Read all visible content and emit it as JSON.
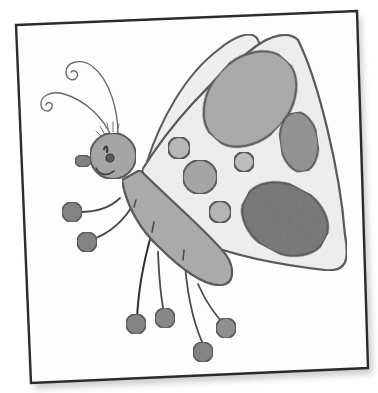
{
  "image": {
    "subject": "pencil drawing of a cartoon butterfly on a tilted paper card",
    "medium": "graphite pencil sketch",
    "colors": {
      "background": "#ffffff",
      "card": "#fdfdfd",
      "card_border": "#2b2b2b",
      "shadow": "#bdbdbd",
      "outline": "#4a4a4a",
      "body_fill": "#a9a9a9",
      "head_fill": "#a3a3a3",
      "wing_fill": "#f1f1f1",
      "light_spot": "#b8b8b8",
      "mid_spot": "#9a9a9a",
      "dark_spot": "#6f6f6f",
      "foot_fill": "#7d7d7d"
    },
    "elements": {
      "card": "white square card rotated slightly counter-clockwise with dark border and soft drop shadow",
      "wings": "two wings: a narrow upper hind wing and a large triangular front wing",
      "wing_spots": "3 large oval spots (upper-center, right, lower) and 4 small round spots",
      "head": "round shaded head with a closed eye, smile and small ear-like bump on the left",
      "antennae": "two curly antennae ending in spirals",
      "legs": "6 thin legs each ending in a round ball foot (2 arms on left, 4 legs below)"
    }
  }
}
